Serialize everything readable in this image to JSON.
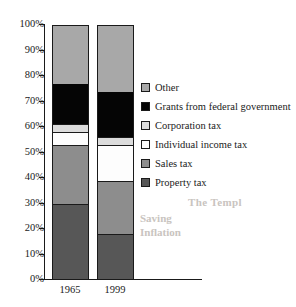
{
  "chart_data": {
    "type": "bar",
    "subtype": "stacked-bar-100-percent",
    "title": "",
    "xlabel": "",
    "ylabel": "",
    "categories": [
      "1965",
      "1999"
    ],
    "ylim": [
      0,
      100
    ],
    "y_ticks": [
      "0%",
      "10%",
      "20%",
      "30%",
      "40%",
      "50%",
      "60%",
      "70%",
      "80%",
      "90%",
      "100%"
    ],
    "y_tick_values": [
      0,
      10,
      20,
      30,
      40,
      50,
      60,
      70,
      80,
      90,
      100
    ],
    "grid": false,
    "legend_position": "right",
    "stack_order_bottom_to_top": [
      "Property tax",
      "Sales tax",
      "Individual income tax",
      "Corporation tax",
      "Grants from federal government",
      "Other"
    ],
    "series": [
      {
        "name": "Property tax",
        "color": "#575757",
        "values": [
          30,
          18
        ]
      },
      {
        "name": "Sales tax",
        "color": "#8d8d8d",
        "values": [
          23,
          21
        ]
      },
      {
        "name": "Individual income tax",
        "color": "#fdfdfd",
        "values": [
          5,
          14
        ]
      },
      {
        "name": "Corporation tax",
        "color": "#dcdcdc",
        "values": [
          3,
          3
        ]
      },
      {
        "name": "Grants from federal government",
        "color": "#050505",
        "values": [
          16,
          18
        ]
      },
      {
        "name": "Other",
        "color": "#a8a8a8",
        "values": [
          23,
          26
        ]
      }
    ],
    "legend_entries": [
      {
        "label": "Other",
        "color": "#a8a8a8"
      },
      {
        "label": "Grants from federal government",
        "color": "#050505"
      },
      {
        "label": "Corporation tax",
        "color": "#dcdcdc"
      },
      {
        "label": "Individual income tax",
        "color": "#fdfdfd"
      },
      {
        "label": "Sales tax",
        "color": "#8d8d8d"
      },
      {
        "label": "Property tax",
        "color": "#575757"
      }
    ]
  },
  "axis": {
    "tick_100": "100%",
    "tick_90": "90%",
    "tick_80": "80%",
    "tick_70": "70%",
    "tick_60": "60%",
    "tick_50": "50%",
    "tick_40": "40%",
    "tick_30": "30%",
    "tick_20": "20%",
    "tick_10": "10%",
    "tick_0": "0%"
  },
  "x_labels": {
    "bar_1": "1965",
    "bar_2": "1999"
  },
  "legend": {
    "item_0": "Other",
    "item_1": "Grants from federal government",
    "item_2": "Corporation tax",
    "item_3": "Individual income tax",
    "item_4": "Sales tax",
    "item_5": "Property tax"
  },
  "bleed_through_text": {
    "line_1": "The Templ",
    "line_2": "Saving",
    "line_3": "Inflation",
    "line_4": ""
  }
}
